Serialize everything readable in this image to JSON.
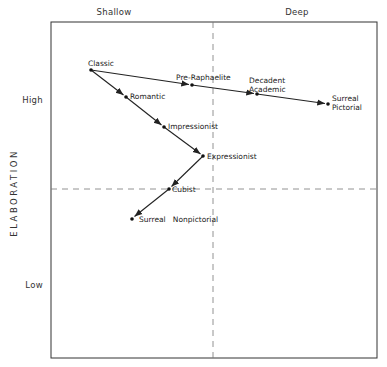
{
  "diagram": {
    "x_axis": {
      "left_label": "Shallow",
      "right_label": "Deep"
    },
    "y_axis": {
      "title": "ELABORATION",
      "high_label": "High",
      "low_label": "Low"
    },
    "nodes": [
      {
        "id": "classic",
        "label": "Classic",
        "x": 91,
        "y": 70
      },
      {
        "id": "pre-raphaelite",
        "label": "Pre-Raphaelite",
        "x": 192,
        "y": 85
      },
      {
        "id": "decadent-academic",
        "label_line1": "Decadent",
        "label_line2": "Academic",
        "x": 257,
        "y": 94
      },
      {
        "id": "surreal-pictorial",
        "label_line1": "Surreal",
        "label_line2": "Pictorial",
        "x": 328,
        "y": 104
      },
      {
        "id": "romantic",
        "label": "Romantic",
        "x": 126,
        "y": 97
      },
      {
        "id": "impressionist",
        "label": "Impressionist",
        "x": 164,
        "y": 127
      },
      {
        "id": "expressionist",
        "label": "Expressionist",
        "x": 203,
        "y": 156
      },
      {
        "id": "cubist",
        "label": "Cubist",
        "x": 169,
        "y": 189
      },
      {
        "id": "surreal-nonpictorial",
        "label": "Surreal   Nonpictorial",
        "x": 132,
        "y": 219
      }
    ],
    "edges": [
      [
        "classic",
        "pre-raphaelite"
      ],
      [
        "pre-raphaelite",
        "decadent-academic"
      ],
      [
        "decadent-academic",
        "surreal-pictorial"
      ],
      [
        "classic",
        "romantic"
      ],
      [
        "romantic",
        "impressionist"
      ],
      [
        "impressionist",
        "expressionist"
      ],
      [
        "expressionist",
        "cubist"
      ],
      [
        "cubist",
        "surreal-nonpictorial"
      ]
    ]
  }
}
